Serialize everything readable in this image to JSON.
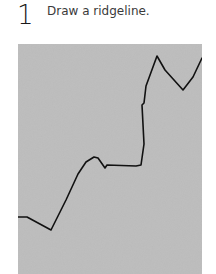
{
  "step": {
    "number": "1",
    "instruction": "Draw a ridgeline."
  },
  "illustration": {
    "background_color": "#bdbdbd",
    "line_color": "#111111",
    "ridgeline_points": [
      [
        0,
        173
      ],
      [
        9,
        173
      ],
      [
        33,
        186
      ],
      [
        48,
        156
      ],
      [
        60,
        130
      ],
      [
        68,
        118
      ],
      [
        76,
        113
      ],
      [
        80,
        114
      ],
      [
        87,
        124
      ],
      [
        89,
        121
      ],
      [
        118,
        122
      ],
      [
        123,
        121
      ],
      [
        126,
        100
      ],
      [
        124,
        61
      ],
      [
        126,
        59
      ],
      [
        128,
        42
      ],
      [
        139,
        12
      ],
      [
        147,
        26
      ],
      [
        165,
        46
      ],
      [
        175,
        33
      ],
      [
        184,
        14
      ]
    ]
  }
}
